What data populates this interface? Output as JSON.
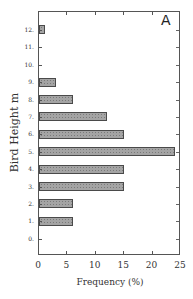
{
  "chart_data": {
    "type": "bar",
    "orientation": "horizontal",
    "panel_label": "A",
    "title": "",
    "xlabel": "Frequency (%)",
    "ylabel": "Bird Height m",
    "categories": [
      "0.",
      "1.",
      "2.",
      "3.",
      "4.",
      "5.",
      "6.",
      "7.",
      "8.",
      "9.",
      "10.",
      "11.",
      "12."
    ],
    "values": [
      0,
      6,
      6,
      15,
      15,
      24,
      15,
      12,
      6,
      3,
      0,
      0,
      1
    ],
    "xlim": [
      0,
      25
    ],
    "xticks": [
      "0",
      "5",
      "10",
      "15",
      "20",
      "25"
    ],
    "grid": false,
    "legend": null,
    "bar_color": "#a4a4a4",
    "bar_edge_color": "#4a4a4a"
  }
}
